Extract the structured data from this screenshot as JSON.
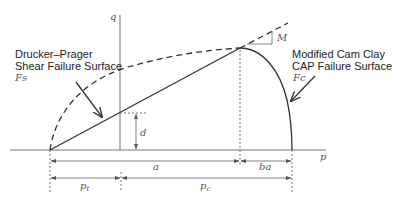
{
  "diagram": {
    "axes": {
      "x_label": "p",
      "y_label": "q"
    },
    "labels": {
      "drucker_prager_line1": "Drucker–Prager",
      "drucker_prager_line2": "Shear Failure Surface",
      "drucker_prager_symbol": "Fs",
      "cam_clay_line1": "Modified Cam Clay",
      "cam_clay_line2": "CAP Failure Surface",
      "cam_clay_symbol": "Fc",
      "slope": "M",
      "cohesion": "d",
      "a": "a",
      "ba": "ba",
      "pt": "p",
      "pt_sub": "t",
      "pc": "p",
      "pc_sub": "c"
    },
    "colors": {
      "line": "#333333",
      "axis": "#777777",
      "text": "#222222"
    }
  }
}
